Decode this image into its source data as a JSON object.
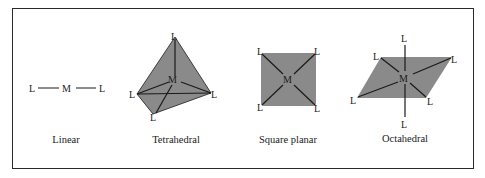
{
  "figure": {
    "geometries": [
      {
        "name": "Linear",
        "center_atom": "M",
        "ligand_atom": "L",
        "ligand_count": 2
      },
      {
        "name": "Tetrahedral",
        "center_atom": "M",
        "ligand_atom": "L",
        "ligand_count": 4
      },
      {
        "name": "Square planar",
        "center_atom": "M",
        "ligand_atom": "L",
        "ligand_count": 4
      },
      {
        "name": "Octahedral",
        "center_atom": "M",
        "ligand_atom": "L",
        "ligand_count": 6
      }
    ],
    "colors": {
      "fill": "#8a8a8a",
      "line": "#1a1a1a",
      "border": "#2a2a2a",
      "background": "#ffffff"
    }
  }
}
